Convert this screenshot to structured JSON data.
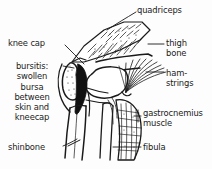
{
  "figure": {
    "style": "black-and-white line drawing",
    "background_color": "#fdfdfd",
    "ink_color": "#1a1a1a"
  },
  "labels": {
    "quadriceps": "quadriceps",
    "thigh_bone_line1": "thigh",
    "thigh_bone_line2": "bone",
    "hamstrings_line1": "ham-",
    "hamstrings_line2": "strings",
    "gastrocnemius_line1": "gastrocnemius",
    "gastrocnemius_line2": "muscle",
    "fibula": "fibula",
    "knee_cap": "knee cap",
    "bursitis_line1": "bursitis:",
    "bursitis_line2": "swollen",
    "bursitis_line3": "bursa",
    "bursitis_line4": "between",
    "bursitis_line5": "skin and",
    "bursitis_line6": "kneecap",
    "shinbone": "shinbone"
  },
  "structures": [
    {
      "name": "quadriceps-muscle",
      "label": "quadriceps",
      "side": "right",
      "rendering": "stippled hatched wedge"
    },
    {
      "name": "thigh-bone",
      "label": "thigh bone",
      "side": "right",
      "rendering": "outlined femur shaft"
    },
    {
      "name": "hamstring-muscles",
      "label": "ham-strings",
      "side": "right",
      "rendering": "radiating fan lines"
    },
    {
      "name": "gastrocnemius-muscle",
      "label": "gastrocnemius muscle",
      "side": "right",
      "rendering": "cross-hatched calf belly"
    },
    {
      "name": "fibula-bone",
      "label": "fibula",
      "side": "right",
      "rendering": "thin outlined bone"
    },
    {
      "name": "knee-cap-patella",
      "label": "knee cap",
      "side": "left",
      "rendering": "stippled oval patella"
    },
    {
      "name": "swollen-bursa",
      "label": "bursitis: swollen bursa between skin and kneecap",
      "side": "left",
      "rendering": "solid black wedge"
    },
    {
      "name": "shin-bone-tibia",
      "label": "shinbone",
      "side": "left",
      "rendering": "outlined tibia shaft"
    }
  ]
}
